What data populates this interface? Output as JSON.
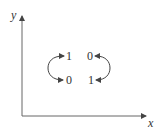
{
  "axes": {
    "x_label": "x",
    "y_label": "y"
  },
  "states": {
    "top_left": "1",
    "top_right": "0",
    "bottom_left": "0",
    "bottom_right": "1"
  },
  "arrows": [
    {
      "from": "top_left",
      "to": "bottom_left",
      "side": "left",
      "bidirectional": true
    },
    {
      "from": "top_right",
      "to": "bottom_right",
      "side": "right",
      "bidirectional": true
    }
  ],
  "colors": {
    "stroke": "#444444",
    "text": "#333333"
  }
}
